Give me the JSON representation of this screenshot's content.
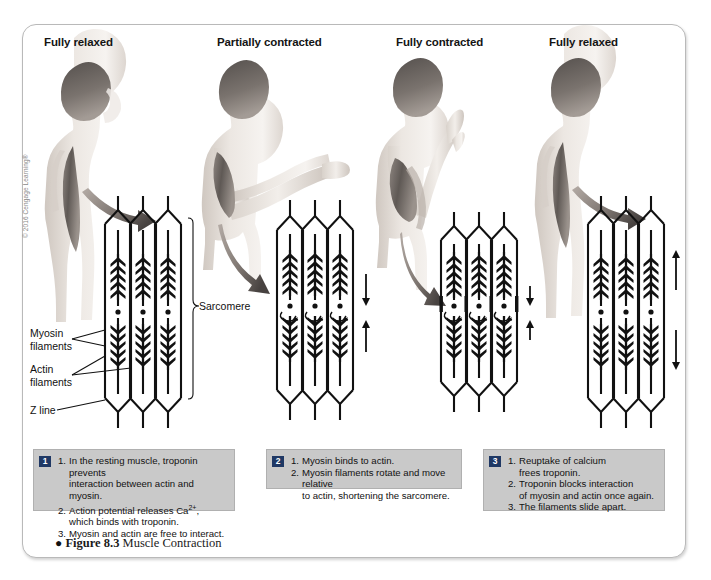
{
  "figure": {
    "number": "Figure 8.3",
    "title": "Muscle Contraction",
    "bullet": "●",
    "copyright": "© 2016 Cengage Learning®"
  },
  "panels": [
    {
      "id": "panel-1",
      "title": "Fully relaxed"
    },
    {
      "id": "panel-2",
      "title": "Partially contracted"
    },
    {
      "id": "panel-3",
      "title": "Fully contracted"
    },
    {
      "id": "panel-4",
      "title": "Fully relaxed"
    }
  ],
  "labels": {
    "sarcomere": "Sarcomere",
    "myosin": "Myosin\nfilaments",
    "actin": "Actin\nfilaments",
    "zline": "Z line"
  },
  "captions": [
    {
      "badge": "1",
      "items": [
        {
          "num": "1.",
          "text": "In the resting muscle, troponin prevents"
        },
        {
          "num": "",
          "text": "interaction between actin and myosin."
        },
        {
          "num": "2.",
          "text": "Action potential releases Ca2+,"
        },
        {
          "num": "",
          "text": "which binds with troponin."
        },
        {
          "num": "3.",
          "text": "Myosin and actin are free to interact."
        }
      ]
    },
    {
      "badge": "2",
      "items": [
        {
          "num": "1.",
          "text": "Myosin binds to actin."
        },
        {
          "num": "2.",
          "text": "Myosin filaments rotate and move relative"
        },
        {
          "num": "",
          "text": "to actin, shortening the sarcomere."
        }
      ]
    },
    {
      "badge": "3",
      "items": [
        {
          "num": "1.",
          "text": "Reuptake of calcium"
        },
        {
          "num": "",
          "text": "frees troponin."
        },
        {
          "num": "2.",
          "text": "Troponin blocks interaction"
        },
        {
          "num": "",
          "text": "of myosin and actin once again."
        },
        {
          "num": "3.",
          "text": "The filaments slide apart."
        }
      ]
    }
  ],
  "colors": {
    "badge_bg": "#1f3864",
    "caption_bg": "#c9c9c9",
    "frame_border": "#b9b9b9",
    "ink": "#111111",
    "skin_light": "#e9e3de",
    "skin_shadow": "#c9c0b8",
    "hair": "#4a4441",
    "muscle": "#7d7672"
  }
}
